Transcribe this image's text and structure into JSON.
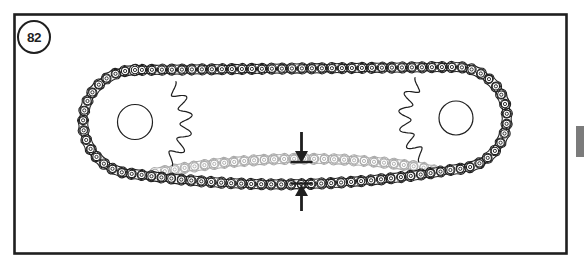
{
  "figure": {
    "label": "82"
  },
  "colors": {
    "background": "#ffffff",
    "ink": "#1f1f1f",
    "slack_chain": "#ababab",
    "page_tab": "#7b7b7b"
  },
  "diagram": {
    "canvas": {
      "w": 584,
      "h": 264
    },
    "border": {
      "x": 14.5,
      "y": 14.5,
      "w": 552,
      "h": 239,
      "stroke_w": 2.6
    },
    "page_tab": {
      "x": 576,
      "y": 126,
      "w": 8,
      "h": 31
    },
    "sprockets": [
      {
        "name": "left-sprocket",
        "cx": 135,
        "cy": 122,
        "wrap_r": 52,
        "hub_r": 17.5,
        "teeth_from_deg": -45,
        "teeth_to_deg": 50,
        "teeth": 5,
        "root_r": 45,
        "tip_r": 57.5
      },
      {
        "name": "right-sprocket",
        "cx": 456,
        "cy": 118,
        "wrap_r": 51,
        "hub_r": 17,
        "teeth_from_deg": 130,
        "teeth_to_deg": 225,
        "teeth": 5,
        "root_r": 45,
        "tip_r": 57.5
      }
    ],
    "chain": {
      "link_spacing": 10,
      "roller_r": 3.7,
      "roller_hole_r": 1.6,
      "plate_w_outer": 5.6,
      "plate_w_inner": 4.6,
      "plate_waist": 2.4,
      "bottom_sag_ctrl": [
        296,
        197
      ],
      "slack_path": {
        "from": [
          155,
          173
        ],
        "ctrl": [
          296,
          146
        ],
        "to": [
          438,
          170
        ]
      }
    },
    "slack_arrows": {
      "x": 301.5,
      "down_arrow": {
        "shaft_top": 132,
        "head_base": 151,
        "tip": 163
      },
      "up_arrow": {
        "shaft_bottom": 211,
        "head_base": 196,
        "tip": 184.5
      },
      "head_half_w": 6.5,
      "shaft_w": 2.8,
      "tick_half_len": 11,
      "upper_tick_y": 162,
      "lower_tick_y": 183.5,
      "tick_w": 2.4
    }
  }
}
